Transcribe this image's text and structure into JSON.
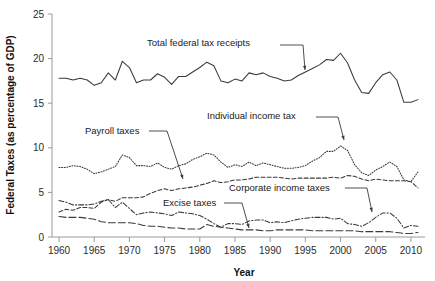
{
  "chart_data": {
    "type": "line",
    "title": "",
    "xlabel": "Year",
    "ylabel": "Federal Taxes (as percentage of GDP)",
    "xlim": [
      1959,
      2012
    ],
    "ylim": [
      0,
      25
    ],
    "yticks": [
      0,
      5,
      10,
      15,
      20,
      25
    ],
    "xticks": [
      1960,
      1965,
      1970,
      1975,
      1980,
      1985,
      1990,
      1995,
      2000,
      2005,
      2010
    ],
    "grid": false,
    "legend": "annotations-with-arrows",
    "x": [
      1960,
      1961,
      1962,
      1963,
      1964,
      1965,
      1966,
      1967,
      1968,
      1969,
      1970,
      1971,
      1972,
      1973,
      1974,
      1975,
      1976,
      1977,
      1978,
      1979,
      1980,
      1981,
      1982,
      1983,
      1984,
      1985,
      1986,
      1987,
      1988,
      1989,
      1990,
      1991,
      1992,
      1993,
      1994,
      1995,
      1996,
      1997,
      1998,
      1999,
      2000,
      2001,
      2002,
      2003,
      2004,
      2005,
      2006,
      2007,
      2008,
      2009,
      2010,
      2011
    ],
    "series": [
      {
        "name": "Total federal tax receipts",
        "style": "solid",
        "values": [
          17.8,
          17.8,
          17.6,
          17.8,
          17.6,
          17.0,
          17.3,
          18.4,
          17.6,
          19.7,
          19.0,
          17.3,
          17.6,
          17.6,
          18.3,
          17.9,
          17.1,
          18.0,
          18.0,
          18.5,
          19.0,
          19.6,
          19.2,
          17.5,
          17.3,
          17.7,
          17.5,
          18.4,
          18.2,
          18.4,
          18.0,
          17.8,
          17.5,
          17.6,
          18.1,
          18.5,
          18.9,
          19.3,
          19.9,
          19.8,
          20.6,
          19.5,
          17.6,
          16.2,
          16.1,
          17.3,
          18.2,
          18.5,
          17.6,
          15.1,
          15.1,
          15.4
        ]
      },
      {
        "name": "Individual income tax",
        "style": "dotted",
        "values": [
          7.8,
          7.8,
          8.0,
          7.9,
          7.6,
          7.1,
          7.3,
          7.6,
          7.9,
          9.2,
          8.9,
          8.0,
          8.0,
          7.9,
          8.3,
          7.8,
          7.6,
          8.0,
          8.2,
          8.7,
          9.0,
          9.4,
          9.2,
          8.4,
          7.8,
          8.1,
          7.9,
          8.4,
          8.0,
          8.3,
          8.1,
          7.9,
          7.7,
          7.7,
          7.8,
          8.0,
          8.5,
          8.9,
          9.6,
          9.6,
          10.2,
          9.7,
          8.1,
          7.2,
          6.9,
          7.5,
          7.9,
          8.4,
          7.9,
          6.4,
          6.2,
          7.3
        ]
      },
      {
        "name": "Payroll taxes",
        "style": "dashed-medium",
        "values": [
          2.8,
          3.1,
          3.0,
          3.3,
          3.3,
          3.2,
          3.9,
          4.2,
          4.0,
          4.4,
          4.4,
          4.4,
          4.5,
          4.9,
          5.2,
          5.4,
          5.2,
          5.4,
          5.5,
          5.6,
          5.8,
          6.0,
          6.3,
          6.1,
          6.2,
          6.4,
          6.4,
          6.5,
          6.7,
          6.7,
          6.7,
          6.7,
          6.6,
          6.5,
          6.6,
          6.6,
          6.6,
          6.6,
          6.6,
          6.7,
          6.6,
          6.9,
          6.8,
          6.5,
          6.3,
          6.5,
          6.4,
          6.3,
          6.3,
          6.3,
          6.2,
          5.5
        ]
      },
      {
        "name": "Corporate income taxes",
        "style": "dash-dot",
        "values": [
          4.1,
          3.9,
          3.6,
          3.6,
          3.6,
          3.7,
          4.0,
          4.2,
          3.3,
          3.9,
          3.2,
          2.5,
          2.7,
          2.8,
          2.7,
          2.6,
          2.4,
          2.8,
          2.7,
          2.6,
          2.4,
          2.0,
          1.5,
          1.1,
          1.5,
          1.5,
          1.4,
          1.8,
          1.9,
          1.9,
          1.6,
          1.7,
          1.6,
          1.8,
          2.0,
          2.1,
          2.2,
          2.2,
          2.2,
          2.0,
          2.1,
          1.5,
          1.4,
          1.2,
          1.6,
          2.2,
          2.7,
          2.7,
          2.1,
          1.0,
          1.3,
          1.2
        ]
      },
      {
        "name": "Excise taxes",
        "style": "dashed-long",
        "values": [
          2.3,
          2.2,
          2.2,
          2.2,
          2.1,
          2.0,
          1.7,
          1.6,
          1.6,
          1.6,
          1.6,
          1.5,
          1.3,
          1.2,
          1.2,
          1.1,
          1.0,
          1.0,
          0.9,
          0.9,
          0.9,
          1.4,
          1.2,
          1.1,
          1.0,
          0.9,
          0.8,
          0.8,
          0.8,
          0.7,
          0.7,
          0.8,
          0.8,
          0.8,
          0.8,
          0.8,
          0.7,
          0.7,
          0.7,
          0.7,
          0.7,
          0.7,
          0.7,
          0.6,
          0.6,
          0.6,
          0.6,
          0.6,
          0.5,
          0.4,
          0.4,
          0.5
        ]
      }
    ],
    "annotations": [
      {
        "id": "total-federal-tax-receipts",
        "text": "Total federal tax receipts",
        "x": 147,
        "y": 46,
        "line": [
          [
            280,
            45
          ],
          [
            303,
            45
          ]
        ],
        "arrow": [
          [
            303,
            45
          ],
          [
            305,
            70
          ]
        ]
      },
      {
        "id": "individual-income-tax",
        "text": "Individual income tax",
        "x": 207,
        "y": 119,
        "line": [
          [
            316,
            117
          ],
          [
            338,
            117
          ]
        ],
        "arrow": [
          [
            338,
            117
          ],
          [
            344,
            140
          ]
        ]
      },
      {
        "id": "payroll-taxes",
        "text": "Payroll taxes",
        "x": 85,
        "y": 134,
        "line": [
          [
            149,
            131
          ],
          [
            167,
            131
          ]
        ],
        "arrow": [
          [
            167,
            131
          ],
          [
            183,
            179
          ]
        ]
      },
      {
        "id": "corporate-income-taxes",
        "text": "Corporate income taxes",
        "x": 229,
        "y": 191,
        "line": [
          [
            345,
            188
          ],
          [
            367,
            188
          ]
        ],
        "arrow": [
          [
            367,
            188
          ],
          [
            372,
            212
          ]
        ]
      },
      {
        "id": "excise-taxes",
        "text": "Excise taxes",
        "x": 163,
        "y": 206,
        "line": [
          [
            224,
            203
          ],
          [
            242,
            203
          ]
        ],
        "arrow": [
          [
            242,
            203
          ],
          [
            249,
            228
          ]
        ]
      }
    ]
  },
  "colors": {
    "line": "#3a3a3a",
    "axis": "#9a9a9a",
    "text": "#1a1a1a",
    "background": "#ffffff"
  }
}
